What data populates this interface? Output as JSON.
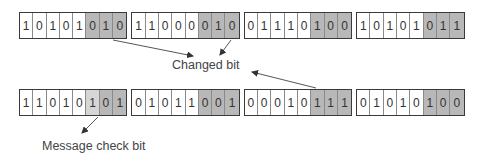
{
  "labels": {
    "changed_bit": "Changed bit",
    "message_check_bit": "Message check bit"
  },
  "colors": {
    "check_bits": "#b8b8b8",
    "message_check_bit": "#d6d6d6",
    "border": "#3a3a3a"
  },
  "top_row": [
    {
      "bits": [
        "1",
        "0",
        "1",
        "0",
        "1",
        "0",
        "1",
        "0"
      ]
    },
    {
      "bits": [
        "1",
        "1",
        "0",
        "0",
        "0",
        "0",
        "1",
        "0"
      ]
    },
    {
      "bits": [
        "0",
        "1",
        "1",
        "1",
        "0",
        "1",
        "0",
        "0"
      ]
    },
    {
      "bits": [
        "1",
        "0",
        "1",
        "0",
        "1",
        "0",
        "1",
        "1"
      ]
    }
  ],
  "bottom_row": [
    {
      "bits": [
        "1",
        "1",
        "0",
        "1",
        "0",
        "1",
        "0",
        "1"
      ]
    },
    {
      "bits": [
        "0",
        "1",
        "0",
        "1",
        "1",
        "0",
        "0",
        "1"
      ]
    },
    {
      "bits": [
        "0",
        "0",
        "0",
        "1",
        "0",
        "1",
        "1",
        "1"
      ]
    },
    {
      "bits": [
        "0",
        "1",
        "0",
        "1",
        "0",
        "1",
        "0",
        "0"
      ]
    }
  ]
}
